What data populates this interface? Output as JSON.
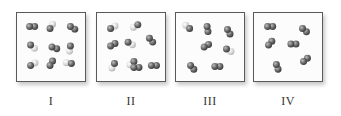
{
  "figure": {
    "colors": {
      "dark_atom": "#6e6e6e",
      "light_atom": "#d8d8d8",
      "border": "#5a5a5a"
    },
    "panels": [
      {
        "label": "I",
        "left": 16,
        "molecules": [
          {
            "x": 13,
            "y": 14,
            "a": "dark",
            "b": "dark",
            "angle": 0
          },
          {
            "x": 34,
            "y": 16,
            "a": "dark",
            "b": "light",
            "angle": -60
          },
          {
            "x": 55,
            "y": 14,
            "a": "dark",
            "b": "dark",
            "angle": 30
          },
          {
            "x": 14,
            "y": 33,
            "a": "dark",
            "b": "light",
            "angle": 40
          },
          {
            "x": 36,
            "y": 35,
            "a": "dark",
            "b": "dark",
            "angle": 20
          },
          {
            "x": 55,
            "y": 34,
            "a": "dark",
            "b": "light",
            "angle": 100
          },
          {
            "x": 14,
            "y": 54,
            "a": "dark",
            "b": "light",
            "angle": -30
          },
          {
            "x": 34,
            "y": 54,
            "a": "dark",
            "b": "dark",
            "angle": -60
          },
          {
            "x": 56,
            "y": 52,
            "a": "dark",
            "b": "light",
            "angle": 190
          }
        ]
      },
      {
        "label": "II",
        "left": 96,
        "molecules": [
          {
            "x": 14,
            "y": 16,
            "a": "dark",
            "b": "light",
            "angle": -30
          },
          {
            "x": 42,
            "y": 12,
            "a": "dark",
            "b": "light",
            "angle": 150
          },
          {
            "x": 14,
            "y": 34,
            "a": "dark",
            "b": "dark",
            "angle": -30
          },
          {
            "x": 32,
            "y": 30,
            "a": "dark",
            "b": "light",
            "angle": 30
          },
          {
            "x": 54,
            "y": 26,
            "a": "dark",
            "b": "dark",
            "angle": 50
          },
          {
            "x": 18,
            "y": 52,
            "a": "dark",
            "b": "light",
            "angle": 120
          },
          {
            "x": 38,
            "y": 50,
            "a": "dark",
            "b": "light",
            "angle": 140
          },
          {
            "x": 38,
            "y": 56,
            "a": "dark",
            "b": "dark",
            "angle": 0
          },
          {
            "x": 56,
            "y": 54,
            "a": "dark",
            "b": "dark",
            "angle": 0
          }
        ]
      },
      {
        "label": "III",
        "left": 175,
        "molecules": [
          {
            "x": 14,
            "y": 16,
            "a": "dark",
            "b": "light",
            "angle": 220
          },
          {
            "x": 32,
            "y": 14,
            "a": "dark",
            "b": "dark",
            "angle": 80
          },
          {
            "x": 53,
            "y": 17,
            "a": "dark",
            "b": "dark",
            "angle": 60
          },
          {
            "x": 29,
            "y": 35,
            "a": "dark",
            "b": "dark",
            "angle": -30
          },
          {
            "x": 52,
            "y": 37,
            "a": "dark",
            "b": "light",
            "angle": 30
          },
          {
            "x": 15,
            "y": 54,
            "a": "dark",
            "b": "dark",
            "angle": 50
          },
          {
            "x": 40,
            "y": 55,
            "a": "dark",
            "b": "dark",
            "angle": 0
          }
        ]
      },
      {
        "label": "IV",
        "left": 253,
        "molecules": [
          {
            "x": 14,
            "y": 14,
            "a": "dark",
            "b": "dark",
            "angle": 0
          },
          {
            "x": 50,
            "y": 16,
            "a": "dark",
            "b": "dark",
            "angle": 40
          },
          {
            "x": 15,
            "y": 33,
            "a": "dark",
            "b": "dark",
            "angle": -50
          },
          {
            "x": 38,
            "y": 32,
            "a": "dark",
            "b": "dark",
            "angle": 0
          },
          {
            "x": 23,
            "y": 53,
            "a": "dark",
            "b": "dark",
            "angle": 70
          },
          {
            "x": 51,
            "y": 50,
            "a": "dark",
            "b": "dark",
            "angle": -40
          }
        ]
      }
    ]
  }
}
